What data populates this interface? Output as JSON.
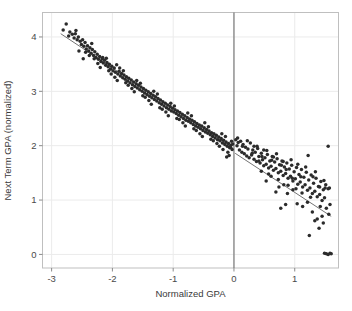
{
  "figure": {
    "background_color": "#ffffff",
    "panel_border_color": "#bfbfbf",
    "grid_color": "#ebebeb",
    "point_color": "#2b2b2b",
    "fit_line_color": "#5a5a5a",
    "cutoff_line_color": "#6e6e6e",
    "axis_text_color": "#4a4a4a"
  },
  "chart_data": {
    "type": "scatter",
    "title": "",
    "subtitle": "",
    "xlabel": "Normalized GPA",
    "ylabel": "Next Term GPA (normalized)",
    "xlim": [
      -3.15,
      1.72
    ],
    "ylim": [
      -0.25,
      4.45
    ],
    "xticks": [
      -3,
      -2,
      -1,
      0,
      1
    ],
    "xticklabels": [
      "-3",
      "-2",
      "-1",
      "0",
      "1"
    ],
    "yticks": [
      0,
      1,
      2,
      3,
      4
    ],
    "yticklabels": [
      "0",
      "1",
      "2",
      "3",
      "4"
    ],
    "grid": true,
    "legend": null,
    "annotations": [
      {
        "name": "cutoff-line",
        "type": "vline",
        "x": 0,
        "label": ""
      }
    ],
    "fit_lines": [
      {
        "name": "fit-left",
        "x": [
          -2.85,
          -0.02
        ],
        "y": [
          4.06,
          1.96
        ]
      },
      {
        "name": "fit-right",
        "x": [
          0.02,
          1.6
        ],
        "y": [
          1.86,
          0.7
        ]
      }
    ],
    "points": [
      [
        -2.81,
        4.13
      ],
      [
        -2.76,
        4.24
      ],
      [
        -2.72,
        4.02
      ],
      [
        -2.7,
        4.09
      ],
      [
        -2.66,
        4.05
      ],
      [
        -2.63,
        3.98
      ],
      [
        -2.61,
        4.06
      ],
      [
        -2.58,
        3.95
      ],
      [
        -2.56,
        4.0
      ],
      [
        -2.53,
        3.92
      ],
      [
        -2.51,
        3.86
      ],
      [
        -2.49,
        3.95
      ],
      [
        -2.47,
        3.83
      ],
      [
        -2.45,
        3.9
      ],
      [
        -2.43,
        3.78
      ],
      [
        -2.41,
        3.84
      ],
      [
        -2.39,
        3.74
      ],
      [
        -2.37,
        3.8
      ],
      [
        -2.35,
        3.7
      ],
      [
        -2.33,
        3.77
      ],
      [
        -2.31,
        3.66
      ],
      [
        -2.29,
        3.73
      ],
      [
        -2.27,
        3.62
      ],
      [
        -2.25,
        3.68
      ],
      [
        -2.23,
        3.59
      ],
      [
        -2.21,
        3.64
      ],
      [
        -2.19,
        3.55
      ],
      [
        -2.17,
        3.6
      ],
      [
        -2.15,
        3.52
      ],
      [
        -2.13,
        3.57
      ],
      [
        -2.11,
        3.48
      ],
      [
        -2.09,
        3.53
      ],
      [
        -2.07,
        3.45
      ],
      [
        -2.05,
        3.5
      ],
      [
        -2.03,
        3.41
      ],
      [
        -2.01,
        3.46
      ],
      [
        -1.99,
        3.38
      ],
      [
        -1.97,
        3.43
      ],
      [
        -1.95,
        3.35
      ],
      [
        -1.93,
        3.49
      ],
      [
        -1.91,
        3.32
      ],
      [
        -1.89,
        3.37
      ],
      [
        -1.87,
        3.28
      ],
      [
        -1.85,
        3.33
      ],
      [
        -1.83,
        3.25
      ],
      [
        -1.81,
        3.3
      ],
      [
        -1.79,
        3.22
      ],
      [
        -1.77,
        3.27
      ],
      [
        -1.75,
        3.19
      ],
      [
        -1.73,
        3.24
      ],
      [
        -1.71,
        3.16
      ],
      [
        -1.69,
        3.21
      ],
      [
        -1.67,
        3.12
      ],
      [
        -1.65,
        3.17
      ],
      [
        -1.63,
        3.09
      ],
      [
        -1.61,
        3.14
      ],
      [
        -1.59,
        3.06
      ],
      [
        -1.57,
        3.11
      ],
      [
        -1.55,
        3.03
      ],
      [
        -1.53,
        3.08
      ],
      [
        -1.51,
        3.0
      ],
      [
        -1.49,
        3.05
      ],
      [
        -1.47,
        2.97
      ],
      [
        -1.45,
        3.02
      ],
      [
        -1.43,
        2.94
      ],
      [
        -1.41,
        2.99
      ],
      [
        -1.39,
        2.91
      ],
      [
        -1.37,
        2.96
      ],
      [
        -1.35,
        2.88
      ],
      [
        -1.33,
        2.93
      ],
      [
        -1.31,
        2.85
      ],
      [
        -1.29,
        2.9
      ],
      [
        -1.27,
        2.82
      ],
      [
        -1.25,
        2.87
      ],
      [
        -1.23,
        2.79
      ],
      [
        -1.21,
        2.84
      ],
      [
        -1.19,
        2.76
      ],
      [
        -1.17,
        2.81
      ],
      [
        -1.15,
        2.73
      ],
      [
        -1.13,
        2.78
      ],
      [
        -1.11,
        2.7
      ],
      [
        -1.09,
        2.75
      ],
      [
        -1.07,
        2.67
      ],
      [
        -1.05,
        2.72
      ],
      [
        -1.03,
        2.64
      ],
      [
        -1.01,
        2.69
      ],
      [
        -0.99,
        2.62
      ],
      [
        -0.97,
        2.66
      ],
      [
        -0.95,
        2.59
      ],
      [
        -0.93,
        2.64
      ],
      [
        -0.91,
        2.56
      ],
      [
        -0.89,
        2.61
      ],
      [
        -0.87,
        2.53
      ],
      [
        -0.85,
        2.58
      ],
      [
        -0.83,
        2.5
      ],
      [
        -0.81,
        2.55
      ],
      [
        -0.79,
        2.47
      ],
      [
        -0.77,
        2.52
      ],
      [
        -0.75,
        2.45
      ],
      [
        -0.73,
        2.49
      ],
      [
        -0.71,
        2.42
      ],
      [
        -0.69,
        2.47
      ],
      [
        -0.67,
        2.39
      ],
      [
        -0.65,
        2.44
      ],
      [
        -0.63,
        2.36
      ],
      [
        -0.61,
        2.41
      ],
      [
        -0.59,
        2.34
      ],
      [
        -0.57,
        2.38
      ],
      [
        -0.55,
        2.31
      ],
      [
        -0.53,
        2.36
      ],
      [
        -0.51,
        2.28
      ],
      [
        -0.49,
        2.33
      ],
      [
        -0.47,
        2.25
      ],
      [
        -0.45,
        2.3
      ],
      [
        -0.43,
        2.23
      ],
      [
        -0.41,
        2.27
      ],
      [
        -0.39,
        2.2
      ],
      [
        -0.37,
        2.24
      ],
      [
        -0.35,
        2.17
      ],
      [
        -0.33,
        2.22
      ],
      [
        -0.31,
        2.14
      ],
      [
        -0.29,
        2.19
      ],
      [
        -0.27,
        2.11
      ],
      [
        -0.25,
        2.16
      ],
      [
        -0.23,
        2.09
      ],
      [
        -0.21,
        2.13
      ],
      [
        -0.19,
        2.05
      ],
      [
        -0.17,
        2.1
      ],
      [
        -0.15,
        2.02
      ],
      [
        -0.13,
        2.07
      ],
      [
        -0.11,
        1.99
      ],
      [
        -0.09,
        2.04
      ],
      [
        -0.07,
        1.96
      ],
      [
        -0.05,
        2.01
      ],
      [
        -0.03,
        1.93
      ],
      [
        -2.6,
        4.12
      ],
      [
        -2.44,
        3.72
      ],
      [
        -2.3,
        3.6
      ],
      [
        -2.16,
        3.62
      ],
      [
        -2.02,
        3.32
      ],
      [
        -1.88,
        3.43
      ],
      [
        -1.74,
        3.11
      ],
      [
        -1.6,
        3.2
      ],
      [
        -1.46,
        2.89
      ],
      [
        -1.32,
        3.0
      ],
      [
        -1.18,
        2.67
      ],
      [
        -1.04,
        2.78
      ],
      [
        -0.9,
        2.48
      ],
      [
        -0.76,
        2.6
      ],
      [
        -0.62,
        2.28
      ],
      [
        -0.48,
        2.42
      ],
      [
        -0.34,
        2.09
      ],
      [
        -0.2,
        2.22
      ],
      [
        -0.1,
        1.88
      ],
      [
        -0.04,
        2.08
      ],
      [
        -2.55,
        3.74
      ],
      [
        -2.38,
        3.66
      ],
      [
        -2.24,
        3.51
      ],
      [
        -2.1,
        3.61
      ],
      [
        -1.96,
        3.26
      ],
      [
        -1.82,
        3.38
      ],
      [
        -1.68,
        3.05
      ],
      [
        -1.54,
        3.15
      ],
      [
        -1.4,
        2.83
      ],
      [
        -1.26,
        2.95
      ],
      [
        -1.12,
        2.62
      ],
      [
        -0.98,
        2.73
      ],
      [
        -0.84,
        2.42
      ],
      [
        -0.7,
        2.55
      ],
      [
        -0.56,
        2.22
      ],
      [
        -0.42,
        2.35
      ],
      [
        -0.28,
        2.04
      ],
      [
        -0.14,
        2.17
      ],
      [
        -0.08,
        1.82
      ],
      [
        -0.02,
        2.03
      ],
      [
        -2.48,
        3.6
      ],
      [
        -2.34,
        3.88
      ],
      [
        -2.2,
        3.44
      ],
      [
        -2.06,
        3.38
      ],
      [
        -1.92,
        3.2
      ],
      [
        -1.78,
        3.16
      ],
      [
        -1.64,
        2.99
      ],
      [
        -1.5,
        2.92
      ],
      [
        -1.36,
        2.76
      ],
      [
        -1.22,
        2.7
      ],
      [
        -1.08,
        2.55
      ],
      [
        -0.94,
        2.5
      ],
      [
        -0.8,
        2.36
      ],
      [
        -0.66,
        2.31
      ],
      [
        -0.52,
        2.17
      ],
      [
        -0.38,
        2.12
      ],
      [
        -0.24,
        1.99
      ],
      [
        -0.18,
        1.93
      ],
      [
        -0.12,
        1.79
      ],
      [
        -0.06,
        1.97
      ],
      [
        0.03,
        2.11
      ],
      [
        0.05,
        2.0
      ],
      [
        0.07,
        2.06
      ],
      [
        0.09,
        1.92
      ],
      [
        0.11,
        2.08
      ],
      [
        0.13,
        1.88
      ],
      [
        0.15,
        2.02
      ],
      [
        0.17,
        1.85
      ],
      [
        0.19,
        1.97
      ],
      [
        0.21,
        1.81
      ],
      [
        0.23,
        1.94
      ],
      [
        0.25,
        1.78
      ],
      [
        0.27,
        2.05
      ],
      [
        0.29,
        1.83
      ],
      [
        0.31,
        1.92
      ],
      [
        0.33,
        1.75
      ],
      [
        0.35,
        1.88
      ],
      [
        0.37,
        1.71
      ],
      [
        0.39,
        1.95
      ],
      [
        0.41,
        1.8
      ],
      [
        0.43,
        1.68
      ],
      [
        0.45,
        1.86
      ],
      [
        0.47,
        1.74
      ],
      [
        0.49,
        1.63
      ],
      [
        0.51,
        1.78
      ],
      [
        0.53,
        1.66
      ],
      [
        0.55,
        1.84
      ],
      [
        0.57,
        1.59
      ],
      [
        0.59,
        1.72
      ],
      [
        0.61,
        1.62
      ],
      [
        0.63,
        1.8
      ],
      [
        0.65,
        1.55
      ],
      [
        0.67,
        1.7
      ],
      [
        0.69,
        1.58
      ],
      [
        0.71,
        1.76
      ],
      [
        0.73,
        1.5
      ],
      [
        0.75,
        1.65
      ],
      [
        0.77,
        1.53
      ],
      [
        0.79,
        1.72
      ],
      [
        0.81,
        1.45
      ],
      [
        0.83,
        1.61
      ],
      [
        0.85,
        1.49
      ],
      [
        0.87,
        1.68
      ],
      [
        0.89,
        1.4
      ],
      [
        0.91,
        1.57
      ],
      [
        0.93,
        1.44
      ],
      [
        0.95,
        1.64
      ],
      [
        0.97,
        1.35
      ],
      [
        0.99,
        1.52
      ],
      [
        1.01,
        1.39
      ],
      [
        1.03,
        1.6
      ],
      [
        1.05,
        1.29
      ],
      [
        1.07,
        1.47
      ],
      [
        1.09,
        1.33
      ],
      [
        1.11,
        1.56
      ],
      [
        1.13,
        1.24
      ],
      [
        1.15,
        1.42
      ],
      [
        1.17,
        1.28
      ],
      [
        1.19,
        1.51
      ],
      [
        1.21,
        1.18
      ],
      [
        1.23,
        1.37
      ],
      [
        1.25,
        1.22
      ],
      [
        1.27,
        1.46
      ],
      [
        1.29,
        1.12
      ],
      [
        1.31,
        1.31
      ],
      [
        1.33,
        1.16
      ],
      [
        1.35,
        1.4
      ],
      [
        1.37,
        1.06
      ],
      [
        1.39,
        1.25
      ],
      [
        1.41,
        1.1
      ],
      [
        1.43,
        1.34
      ],
      [
        1.45,
        0.99
      ],
      [
        1.47,
        1.19
      ],
      [
        1.49,
        1.04
      ],
      [
        1.51,
        1.28
      ],
      [
        0.06,
        2.14
      ],
      [
        0.14,
        1.99
      ],
      [
        0.22,
        2.09
      ],
      [
        0.3,
        1.86
      ],
      [
        0.38,
        1.99
      ],
      [
        0.46,
        1.8
      ],
      [
        0.54,
        1.91
      ],
      [
        0.62,
        1.73
      ],
      [
        0.7,
        1.85
      ],
      [
        0.78,
        1.64
      ],
      [
        0.86,
        1.56
      ],
      [
        0.94,
        1.74
      ],
      [
        1.02,
        1.21
      ],
      [
        1.1,
        1.43
      ],
      [
        1.18,
        1.61
      ],
      [
        1.26,
        1.05
      ],
      [
        1.34,
        1.52
      ],
      [
        1.42,
        0.88
      ],
      [
        1.5,
        1.22
      ],
      [
        1.55,
        1.21
      ],
      [
        0.33,
        1.99
      ],
      [
        0.41,
        1.72
      ],
      [
        0.49,
        1.92
      ],
      [
        0.57,
        1.48
      ],
      [
        0.65,
        1.79
      ],
      [
        0.73,
        1.38
      ],
      [
        0.81,
        1.71
      ],
      [
        0.89,
        1.27
      ],
      [
        0.97,
        1.19
      ],
      [
        1.05,
        1.66
      ],
      [
        0.77,
        0.85
      ],
      [
        0.85,
        0.92
      ],
      [
        1.13,
        0.88
      ],
      [
        1.21,
        0.96
      ],
      [
        1.29,
        0.78
      ],
      [
        1.37,
        0.65
      ],
      [
        1.45,
        0.7
      ],
      [
        1.52,
        0.85
      ],
      [
        1.56,
        0.74
      ],
      [
        1.4,
        0.48
      ],
      [
        1.33,
        0.62
      ],
      [
        1.47,
        0.58
      ],
      [
        1.24,
        0.35
      ],
      [
        1.58,
        0.92
      ],
      [
        1.3,
        1.43
      ],
      [
        1.22,
        1.82
      ],
      [
        1.55,
        1.99
      ],
      [
        1.57,
        1.22
      ],
      [
        1.48,
        1.36
      ],
      [
        1.41,
        1.24
      ],
      [
        1.49,
        0.02
      ],
      [
        1.52,
        0.01
      ],
      [
        1.55,
        0.0
      ],
      [
        1.58,
        0.02
      ],
      [
        1.6,
        0.01
      ],
      [
        0.45,
        1.53
      ],
      [
        0.53,
        1.35
      ],
      [
        0.61,
        1.44
      ],
      [
        0.69,
        1.15
      ],
      [
        0.88,
        1.12
      ],
      [
        0.96,
        1.4
      ],
      [
        1.04,
        0.93
      ],
      [
        1.12,
        1.13
      ],
      [
        0.82,
        1.28
      ],
      [
        0.74,
        1.24
      ]
    ]
  }
}
